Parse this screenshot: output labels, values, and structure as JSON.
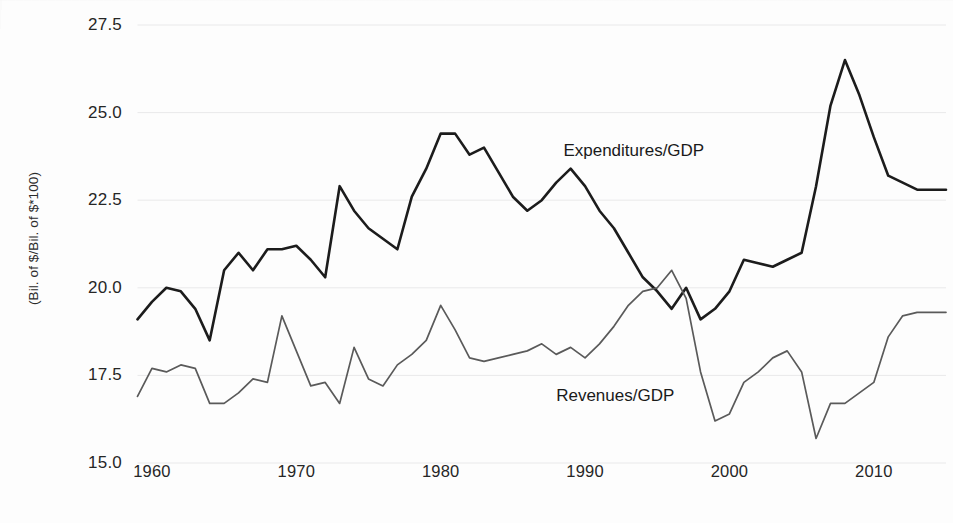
{
  "chart_data": {
    "type": "line",
    "title": "",
    "xlabel": "",
    "ylabel": "(Bil. of $/Bil. of $*100)",
    "xlim": [
      1959,
      2015
    ],
    "ylim": [
      15.0,
      27.5
    ],
    "grid": true,
    "legend_position": "inline-annotation",
    "y_ticks": [
      "15.0",
      "17.5",
      "20.0",
      "22.5",
      "25.0",
      "27.5"
    ],
    "y_tick_values": [
      15.0,
      17.5,
      20.0,
      22.5,
      25.0,
      27.5
    ],
    "x_ticks": [
      "1960",
      "1970",
      "1980",
      "1990",
      "2000",
      "2010"
    ],
    "x_tick_values": [
      1960,
      1970,
      1980,
      1990,
      2000,
      2010
    ],
    "x": [
      1959,
      1960,
      1961,
      1962,
      1963,
      1964,
      1965,
      1966,
      1967,
      1968,
      1969,
      1970,
      1971,
      1972,
      1973,
      1974,
      1975,
      1976,
      1977,
      1978,
      1979,
      1980,
      1981,
      1982,
      1983,
      1984,
      1985,
      1986,
      1987,
      1988,
      1989,
      1990,
      1991,
      1992,
      1993,
      1994,
      1995,
      1996,
      1997,
      1998,
      1999,
      2000,
      2001,
      2002,
      2003,
      2004,
      2005,
      2006,
      2007,
      2008,
      2009,
      2010,
      2011,
      2012,
      2013,
      2014,
      2015
    ],
    "series": [
      {
        "name": "Expenditures/GDP",
        "color": "#1c1c1c",
        "label_x": 1988.5,
        "label_y": 23.9,
        "values": [
          19.1,
          19.6,
          20.0,
          19.9,
          19.4,
          18.5,
          20.5,
          21.0,
          20.5,
          21.1,
          21.1,
          21.2,
          20.8,
          20.3,
          22.9,
          22.2,
          21.7,
          21.4,
          21.1,
          22.6,
          23.4,
          24.4,
          24.4,
          23.8,
          24.0,
          23.3,
          22.6,
          22.2,
          22.5,
          23.0,
          23.4,
          22.9,
          22.2,
          21.7,
          21.0,
          20.3,
          19.9,
          19.4,
          20.0,
          19.1,
          19.4,
          19.9,
          20.8,
          20.7,
          20.6,
          20.8,
          21.0,
          22.9,
          25.2,
          26.5,
          25.5,
          24.3,
          23.2,
          23.0,
          22.8,
          22.8,
          22.8
        ]
      },
      {
        "name": "Revenues/GDP",
        "color": "#5a5a5a",
        "label_x": 1988.0,
        "label_y": 16.9,
        "values": [
          16.9,
          17.7,
          17.6,
          17.8,
          17.7,
          16.7,
          16.7,
          17.0,
          17.4,
          17.3,
          19.2,
          18.2,
          17.2,
          17.3,
          16.7,
          18.3,
          17.4,
          17.2,
          17.8,
          18.1,
          18.5,
          19.5,
          18.8,
          18.0,
          17.9,
          18.0,
          18.1,
          18.2,
          18.4,
          18.1,
          18.3,
          18.0,
          18.4,
          18.9,
          19.5,
          19.9,
          20.0,
          20.5,
          19.7,
          17.6,
          16.2,
          16.4,
          17.3,
          17.6,
          18.0,
          18.2,
          17.6,
          15.7,
          16.7,
          16.7,
          17.0,
          17.3,
          18.6,
          19.2,
          19.3,
          19.3,
          19.3
        ]
      }
    ]
  }
}
